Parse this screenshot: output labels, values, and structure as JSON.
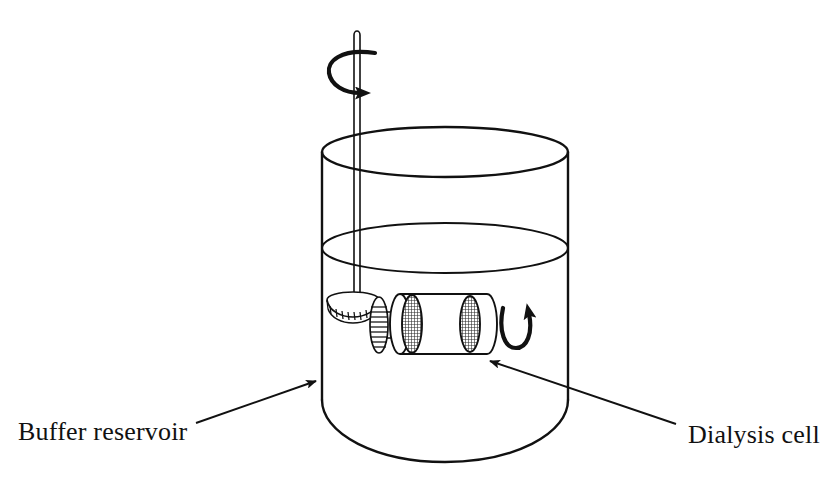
{
  "figure": {
    "background_color": "#ffffff",
    "ink_color": "#111111"
  },
  "labels": [
    {
      "id": "buffer-reservoir",
      "text": "Buffer reservoir",
      "x": 18,
      "y": 440,
      "anchor": "start",
      "leader": {
        "from_x": 196,
        "from_y": 423,
        "to_x": 316,
        "to_y": 381,
        "arrowhead": "filled-triangle"
      }
    },
    {
      "id": "dialysis-cell",
      "text": "Dialysis cell",
      "x": 688,
      "y": 443,
      "anchor": "start",
      "leader": {
        "from_x": 676,
        "from_y": 424,
        "to_x": 490,
        "to_y": 361,
        "arrowhead": "filled-triangle"
      }
    }
  ],
  "parts": {
    "beaker": {
      "name": "buffer reservoir beaker",
      "left_x": 322,
      "right_x": 568,
      "rim_center_y": 152,
      "rim_radius_y": 25,
      "body_bottom_y": 400,
      "bottom_round_radius_y": 62,
      "stroke_width": 2.4
    },
    "liquid_surface": {
      "name": "buffer liquid level",
      "center_y": 248,
      "radius_y": 25,
      "stroke_width": 1.8
    },
    "shaft": {
      "name": "rotating drive shaft",
      "x": 357,
      "top_y": 30,
      "bottom_y": 304,
      "width": 6
    },
    "top_rotation_arrow": {
      "name": "shaft rotation arrow",
      "center_x": 357,
      "center_y": 72,
      "direction": "clockwise-right"
    },
    "bevel_gear_shaft": {
      "name": "shaft bevel gear",
      "center_x": 352,
      "center_y": 305,
      "radius_x": 25,
      "radius_y": 8,
      "teeth": 11
    },
    "bevel_gear_cell": {
      "name": "cell drive gear",
      "center_x": 379,
      "center_y": 325,
      "radius_x": 9,
      "radius_y": 28,
      "teeth": 12
    },
    "cell_body": {
      "name": "dialysis cell cylinder",
      "left_x": 392,
      "right_x": 487,
      "center_y": 324,
      "radius_y": 30
    },
    "membranes": [
      {
        "name": "membrane-left",
        "center_x": 411,
        "center_y": 324,
        "radius_x": 10,
        "radius_y": 29
      },
      {
        "name": "membrane-right",
        "center_x": 470,
        "center_y": 324,
        "radius_x": 10,
        "radius_y": 28
      }
    ],
    "cell_rotation_arrow": {
      "name": "cell rotation arrow",
      "center_x": 516,
      "center_y": 330,
      "direction": "counter-clockwise-up"
    }
  }
}
